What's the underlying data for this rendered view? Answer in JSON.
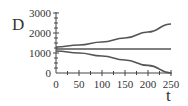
{
  "chart_data": {
    "type": "line",
    "title": "",
    "xlabel": "t",
    "ylabel": "D",
    "xlim": [
      0,
      250
    ],
    "ylim": [
      0,
      3000
    ],
    "x_ticks": [
      0,
      50,
      100,
      150,
      200,
      250
    ],
    "y_ticks": [
      0,
      1000,
      2000,
      3000
    ],
    "grid": false,
    "legend": null,
    "x": [
      0,
      50,
      100,
      150,
      200,
      250
    ],
    "series": [
      {
        "name": "upper",
        "values": [
          1300,
          1400,
          1550,
          1750,
          2050,
          2450
        ]
      },
      {
        "name": "middle",
        "values": [
          1200,
          1200,
          1200,
          1200,
          1200,
          1200
        ]
      },
      {
        "name": "lower",
        "values": [
          1100,
          1000,
          850,
          650,
          380,
          0
        ]
      }
    ]
  },
  "labels": {
    "y_axis": "D",
    "x_axis": "t",
    "x_ticks": [
      "0",
      "50",
      "100",
      "150",
      "200",
      "250"
    ],
    "y_ticks": [
      "0",
      "1000",
      "2000",
      "3000"
    ]
  }
}
